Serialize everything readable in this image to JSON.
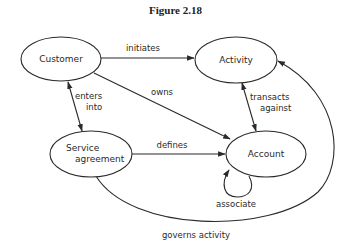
{
  "figure": {
    "title": "Figure 2.18"
  },
  "nodes": {
    "customer": {
      "label": "Customer"
    },
    "activity": {
      "label": "Activity"
    },
    "service_agreement": {
      "label_line1": "Service",
      "label_line2": "agreement"
    },
    "account": {
      "label": "Account"
    }
  },
  "edges": {
    "initiates": {
      "label": "initiates",
      "from": "Customer",
      "to": "Activity"
    },
    "owns": {
      "label": "owns",
      "from": "Customer",
      "to": "Account"
    },
    "enters_into": {
      "label_line1": "enters",
      "label_line2": "into",
      "from": "Customer",
      "to": "Service agreement",
      "bidirectional": true
    },
    "transacts_against": {
      "label_line1": "transacts",
      "label_line2": "against",
      "from": "Activity",
      "to": "Account",
      "bidirectional": true
    },
    "defines": {
      "label": "defines",
      "from": "Service agreement",
      "to": "Account"
    },
    "associate": {
      "label": "associate",
      "from": "Account",
      "to": "Account"
    },
    "governs_activity": {
      "label": "governs activity",
      "from": "Service agreement",
      "to": "Activity"
    }
  }
}
